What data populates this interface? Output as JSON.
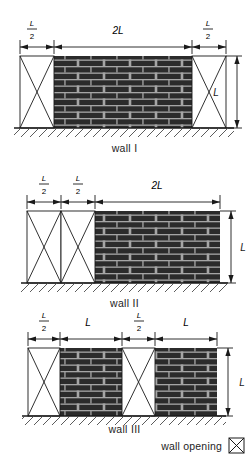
{
  "figure": {
    "type": "engineering-elevation-diagram",
    "background_color": "#ffffff",
    "brick_color": "#2b2b2b",
    "mortar_color": "#9a9a9a",
    "line_color": "#1a1a1a",
    "opening_fill": "#ffffff"
  },
  "dimension_symbols": {
    "half": {
      "numerator": "L",
      "denominator": "2"
    },
    "full": "L",
    "double": "2L"
  },
  "walls": [
    {
      "id": "wall-1",
      "caption": "wall  I",
      "height_label": "L",
      "top_dimensions": [
        {
          "label_type": "fraction",
          "numerator": "L",
          "denominator": "2",
          "span": "L/2"
        },
        {
          "label_type": "plain",
          "text": "2L",
          "span": "2L"
        },
        {
          "label_type": "fraction",
          "numerator": "L",
          "denominator": "2",
          "span": "L/2"
        }
      ],
      "segments": [
        {
          "kind": "opening",
          "width": "L/2"
        },
        {
          "kind": "brick",
          "width": "2L"
        },
        {
          "kind": "opening",
          "width": "L/2"
        }
      ]
    },
    {
      "id": "wall-2",
      "caption": "wall  II",
      "height_label": "L",
      "top_dimensions": [
        {
          "label_type": "fraction",
          "numerator": "L",
          "denominator": "2",
          "span": "L/2"
        },
        {
          "label_type": "fraction",
          "numerator": "L",
          "denominator": "2",
          "span": "L/2"
        },
        {
          "label_type": "plain",
          "text": "2L",
          "span": "2L"
        }
      ],
      "segments": [
        {
          "kind": "opening",
          "width": "L/2"
        },
        {
          "kind": "opening",
          "width": "L/2"
        },
        {
          "kind": "brick",
          "width": "2L"
        }
      ]
    },
    {
      "id": "wall-3",
      "caption": "wall  III",
      "height_label": "L",
      "top_dimensions": [
        {
          "label_type": "fraction",
          "numerator": "L",
          "denominator": "2",
          "span": "L/2"
        },
        {
          "label_type": "plain",
          "text": "L",
          "span": "L"
        },
        {
          "label_type": "fraction",
          "numerator": "L",
          "denominator": "2",
          "span": "L/2"
        },
        {
          "label_type": "plain",
          "text": "L",
          "span": "L"
        }
      ],
      "segments": [
        {
          "kind": "opening",
          "width": "L/2"
        },
        {
          "kind": "brick",
          "width": "L"
        },
        {
          "kind": "opening",
          "width": "L/2"
        },
        {
          "kind": "brick",
          "width": "L"
        }
      ]
    }
  ],
  "legend": {
    "label": "wall opening",
    "symbol": "crossed-box"
  }
}
